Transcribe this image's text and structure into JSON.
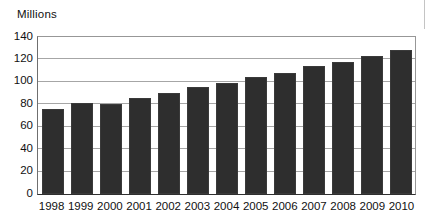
{
  "figure": {
    "y_axis_title": "Millions"
  },
  "chart_data": {
    "type": "bar",
    "title": "",
    "xlabel": "",
    "ylabel": "Millions",
    "categories": [
      "1998",
      "1999",
      "2000",
      "2001",
      "2002",
      "2003",
      "2004",
      "2005",
      "2006",
      "2007",
      "2008",
      "2009",
      "2010"
    ],
    "values": [
      76,
      81,
      80,
      86,
      90,
      95,
      99,
      104,
      108,
      114,
      118,
      123,
      128
    ],
    "ylim": [
      0,
      140
    ],
    "ytick_step": 20,
    "grid": true,
    "legend": false,
    "bar_color": "#2e2e2e",
    "gridline_color": "#a6a6a6",
    "axis_box_color": "#979797",
    "text_color": "#111111"
  }
}
